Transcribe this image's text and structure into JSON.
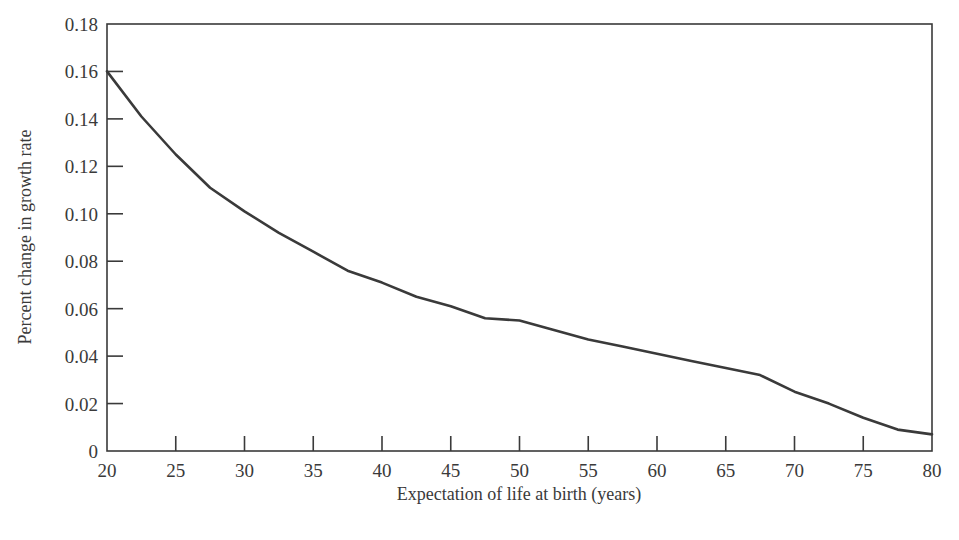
{
  "chart_data": {
    "type": "line",
    "title": "",
    "xlabel": "Expectation of life at birth (years)",
    "ylabel": "Percent change in growth rate",
    "xlim": [
      20,
      80
    ],
    "ylim": [
      0,
      0.18
    ],
    "grid": false,
    "legend": null,
    "x_ticks": [
      20,
      25,
      30,
      35,
      40,
      45,
      50,
      55,
      60,
      65,
      70,
      75,
      80
    ],
    "x_tick_labels": [
      "20",
      "25",
      "30",
      "35",
      "40",
      "45",
      "50",
      "55",
      "60",
      "65",
      "70",
      "75",
      "80"
    ],
    "y_ticks": [
      0,
      0.02,
      0.04,
      0.06,
      0.08,
      0.1,
      0.12,
      0.14,
      0.16,
      0.18
    ],
    "y_tick_labels": [
      "0",
      "0.02",
      "0.04",
      "0.06",
      "0.08",
      "0.10",
      "0.12",
      "0.14",
      "0.16",
      "0.18"
    ],
    "series": [
      {
        "name": "Percent change in growth rate",
        "color": "#3a3a3a",
        "x": [
          20,
          22.5,
          25,
          27.5,
          30,
          32.5,
          35,
          37.5,
          40,
          42.5,
          45,
          47.5,
          50,
          52.5,
          55,
          57.5,
          60,
          62.5,
          65,
          67.5,
          70,
          72.5,
          75,
          77.5,
          80
        ],
        "y": [
          0.16,
          0.141,
          0.125,
          0.111,
          0.101,
          0.092,
          0.084,
          0.076,
          0.071,
          0.065,
          0.061,
          0.056,
          0.055,
          0.051,
          0.047,
          0.044,
          0.041,
          0.038,
          0.035,
          0.032,
          0.025,
          0.02,
          0.014,
          0.009,
          0.007
        ]
      }
    ]
  }
}
